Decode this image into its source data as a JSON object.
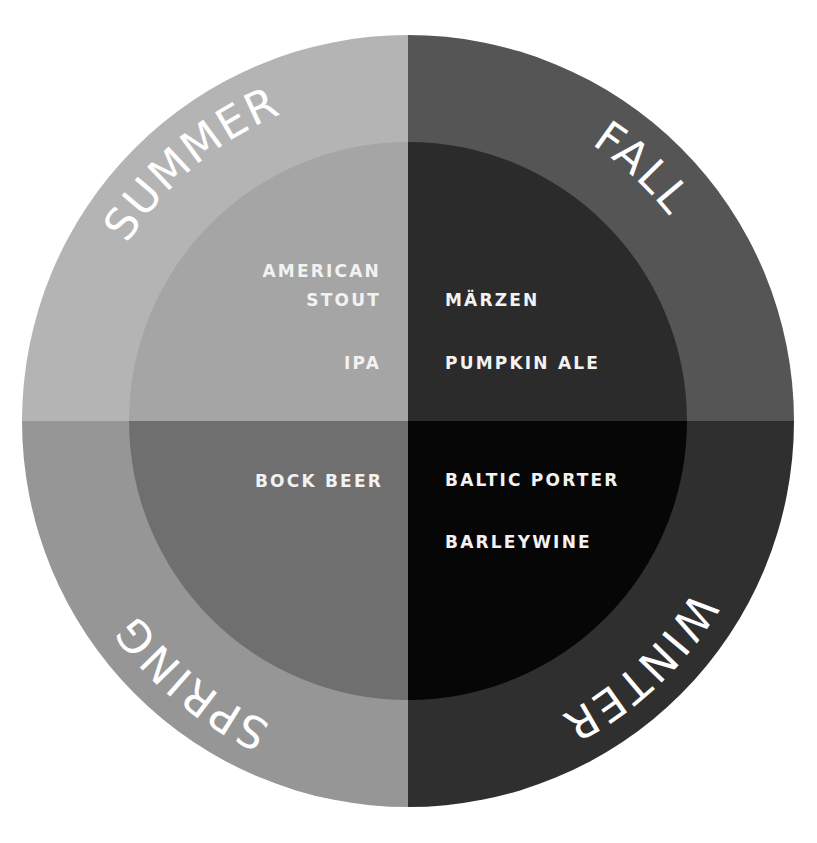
{
  "diagram": {
    "center": {
      "x": 408,
      "y": 421
    },
    "outer_radius": 386,
    "inner_radius": 279,
    "label_radius": 332
  },
  "quadrants": {
    "summer": {
      "season": "SUMMER",
      "outer_color": "#b4b4b4",
      "inner_color": "#a5a5a5",
      "label_offset": "13.9%",
      "beers": [
        "AMERICAN",
        "STOUT",
        "IPA"
      ]
    },
    "fall": {
      "season": "FALL",
      "outer_color": "#555555",
      "inner_color": "#2b2b2b",
      "label_offset": "36.9%",
      "beers": [
        "MÄRZEN",
        "PUMPKIN ALE"
      ]
    },
    "winter": {
      "season": "WINTER",
      "outer_color": "#2f2f2f",
      "inner_color": "#060606",
      "label_offset": "63%",
      "beers": [
        "BALTIC PORTER",
        "BARLEYWINE"
      ]
    },
    "spring": {
      "season": "SPRING",
      "outer_color": "#969696",
      "inner_color": "#6f6f6f",
      "label_offset": "86%",
      "beers": [
        "BOCK BEER"
      ]
    }
  },
  "text_color": "#ffffff"
}
